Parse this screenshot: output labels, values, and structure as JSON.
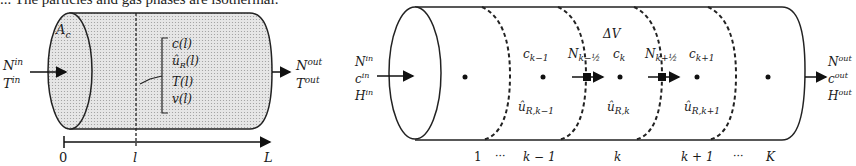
{
  "caption": "... The particles and gas phases are isothermal.",
  "left_diagram": {
    "inlet": {
      "line1": "N",
      "sup1": "in",
      "line2": "T",
      "sup2": "in"
    },
    "outlet": {
      "line1": "N",
      "sup1": "out",
      "line2": "T",
      "sup2": "out"
    },
    "area_label": "A",
    "area_sub": "c",
    "state_vars": [
      "c(l)",
      "û",
      "T(l)",
      "v(l)"
    ],
    "state_var_u_sub": "R",
    "state_var_u_arg": "(l)",
    "axis_ticks": [
      "0",
      "l",
      "L"
    ]
  },
  "right_diagram": {
    "inlet": [
      "N",
      "c",
      "H"
    ],
    "inlet_sup": "in",
    "outlet": [
      "N",
      "c",
      "H"
    ],
    "outlet_sup": "out",
    "volume_label": "ΔV",
    "cells": [
      {
        "c_label": "c",
        "c_sub": "k−1",
        "u_label": "û",
        "u_sub": "R,k−1"
      },
      {
        "c_label": "c",
        "c_sub": "k",
        "u_label": "û",
        "u_sub": "R,k"
      },
      {
        "c_label": "c",
        "c_sub": "k+1",
        "u_label": "û",
        "u_sub": "R,k+1"
      }
    ],
    "flux_labels": [
      {
        "label": "N",
        "sub": "k−½"
      },
      {
        "label": "N",
        "sub": "k+½"
      }
    ],
    "axis_labels": [
      "1",
      "···",
      "k − 1",
      "k",
      "k + 1",
      "···",
      "K"
    ]
  }
}
